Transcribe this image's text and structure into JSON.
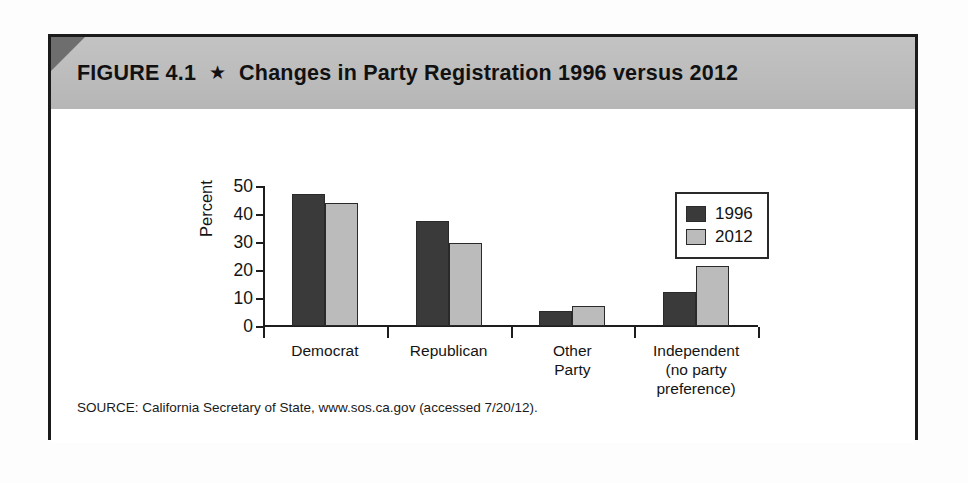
{
  "figure": {
    "label": "FIGURE 4.1",
    "star_icon": "★",
    "title": "Changes in Party Registration 1996 versus 2012",
    "source": "SOURCE: California Secretary of State, www.sos.ca.gov (accessed 7/20/12)."
  },
  "colors": {
    "series_1996": "#3a3a3a",
    "series_2012": "#bbbbbb",
    "banner": "#bdbdbd",
    "frame": "#1b1b1b",
    "axis": "#1d1d1d"
  },
  "chart_data": {
    "type": "bar",
    "title": "Changes in Party Registration 1996 versus 2012",
    "categories": [
      "Democrat",
      "Republican",
      "Other Party",
      "Independent (no party preference)"
    ],
    "category_lines": [
      [
        "Democrat"
      ],
      [
        "Republican"
      ],
      [
        "Other",
        "Party"
      ],
      [
        "Independent",
        "(no party",
        "preference)"
      ]
    ],
    "series": [
      {
        "name": "1996",
        "values": [
          47,
          37.5,
          5.5,
          12
        ]
      },
      {
        "name": "2012",
        "values": [
          44,
          29.5,
          7,
          21.5
        ]
      }
    ],
    "xlabel": "",
    "ylabel": "Percent",
    "ylim": [
      0,
      50
    ],
    "yticks": [
      0,
      10,
      20,
      30,
      40,
      50
    ],
    "ytick_labels": [
      "0",
      "10",
      "20",
      "30",
      "40",
      "50"
    ],
    "grid": false,
    "legend_position": "top-right"
  }
}
